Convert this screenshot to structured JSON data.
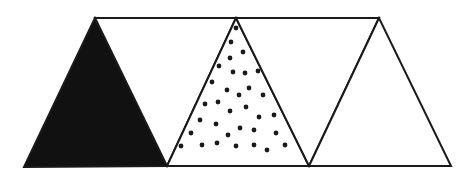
{
  "diagram": {
    "colors": {
      "stroke": "#1a1a1a",
      "solid_fill": "#111111",
      "background": "#ffffff",
      "dot": "#1a1a1a"
    },
    "triangles": [
      {
        "name": "solid-triangle",
        "fill": "solid",
        "points": "95,18 24,167 167,166"
      },
      {
        "name": "blank-inverted-triangle-1",
        "fill": "none",
        "points": "95,18 236,18 167,166"
      },
      {
        "name": "dotted-triangle",
        "fill": "dots",
        "points": "236,18 167,166 309,166"
      },
      {
        "name": "blank-inverted-triangle-2",
        "fill": "none",
        "points": "236,18 379,18 309,166"
      },
      {
        "name": "blank-triangle",
        "fill": "none",
        "points": "379,18 309,166 451,166"
      }
    ],
    "dots": [
      [
        236,
        28
      ],
      [
        231,
        42
      ],
      [
        243,
        52
      ],
      [
        230,
        58
      ],
      [
        219,
        66
      ],
      [
        233,
        72
      ],
      [
        245,
        73
      ],
      [
        258,
        71
      ],
      [
        212,
        82
      ],
      [
        227,
        90
      ],
      [
        249,
        88
      ],
      [
        239,
        95
      ],
      [
        263,
        95
      ],
      [
        205,
        104
      ],
      [
        218,
        102
      ],
      [
        230,
        111
      ],
      [
        246,
        107
      ],
      [
        200,
        120
      ],
      [
        216,
        124
      ],
      [
        259,
        117
      ],
      [
        274,
        115
      ],
      [
        191,
        133
      ],
      [
        240,
        128
      ],
      [
        228,
        135
      ],
      [
        254,
        130
      ],
      [
        276,
        133
      ],
      [
        181,
        146
      ],
      [
        202,
        145
      ],
      [
        217,
        143
      ],
      [
        236,
        146
      ],
      [
        254,
        145
      ],
      [
        267,
        150
      ],
      [
        285,
        145
      ]
    ]
  }
}
